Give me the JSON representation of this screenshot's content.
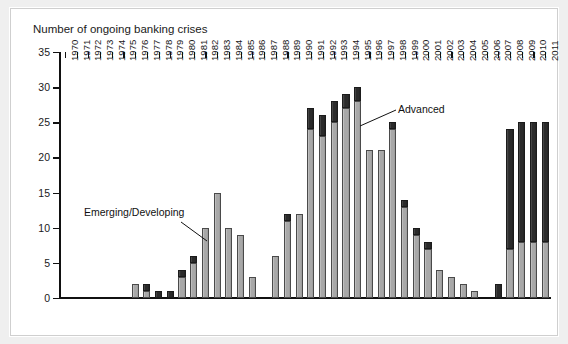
{
  "chart_data": {
    "type": "bar",
    "stacked": true,
    "title": "Number of ongoing banking crises",
    "xlabel": "",
    "ylabel": "",
    "ylim": [
      0,
      35
    ],
    "yticks": [
      0,
      5,
      10,
      15,
      20,
      25,
      30,
      35
    ],
    "grid": false,
    "legend_position": "inline-annotations",
    "categories": [
      "1970",
      "1971",
      "1972",
      "1973",
      "1974",
      "1975",
      "1976",
      "1977",
      "1978",
      "1979",
      "1980",
      "1981",
      "1982",
      "1983",
      "1984",
      "1985",
      "1986",
      "1987",
      "1988",
      "1989",
      "1990",
      "1991",
      "1992",
      "1993",
      "1994",
      "1995",
      "1996",
      "1997",
      "1998",
      "1999",
      "2000",
      "2001",
      "2002",
      "2003",
      "2004",
      "2005",
      "2006",
      "2007",
      "2008",
      "2009",
      "2010",
      "2011"
    ],
    "series": [
      {
        "name": "Emerging/Developing",
        "color": "#a8a8a8",
        "values": [
          0,
          0,
          0,
          0,
          0,
          0,
          2,
          1,
          0,
          0,
          3,
          5,
          10,
          15,
          10,
          9,
          3,
          0,
          6,
          11,
          12,
          24,
          23,
          25,
          27,
          28,
          21,
          21,
          24,
          13,
          9,
          7,
          4,
          3,
          2,
          1,
          0,
          0,
          7,
          8,
          8,
          8
        ]
      },
      {
        "name": "Advanced",
        "color": "#2b2b2b",
        "values": [
          0,
          0,
          0,
          0,
          0,
          0,
          0,
          1,
          1,
          1,
          1,
          1,
          0,
          0,
          0,
          0,
          0,
          0,
          0,
          1,
          0,
          3,
          3,
          3,
          2,
          2,
          0,
          0,
          1,
          1,
          1,
          1,
          0,
          0,
          0,
          0,
          0,
          2,
          17,
          17,
          17,
          17
        ]
      }
    ],
    "totals": [
      0,
      0,
      0,
      0,
      0,
      0,
      2,
      2,
      1,
      1,
      4,
      6,
      10,
      15,
      10,
      9,
      3,
      0,
      6,
      12,
      12,
      27,
      26,
      28,
      29,
      30,
      21,
      21,
      25,
      14,
      10,
      8,
      4,
      3,
      2,
      1,
      0,
      2,
      24,
      25,
      25,
      25
    ],
    "annotations": [
      {
        "text": "Emerging/Developing",
        "points_to_year": "1982"
      },
      {
        "text": "Advanced",
        "points_to_year": "1998"
      }
    ]
  },
  "colors": {
    "emerging": "#a8a8a8",
    "advanced": "#2b2b2b",
    "axis": "#111111",
    "page_background": "#efefef",
    "panel_background": "#ffffff"
  }
}
